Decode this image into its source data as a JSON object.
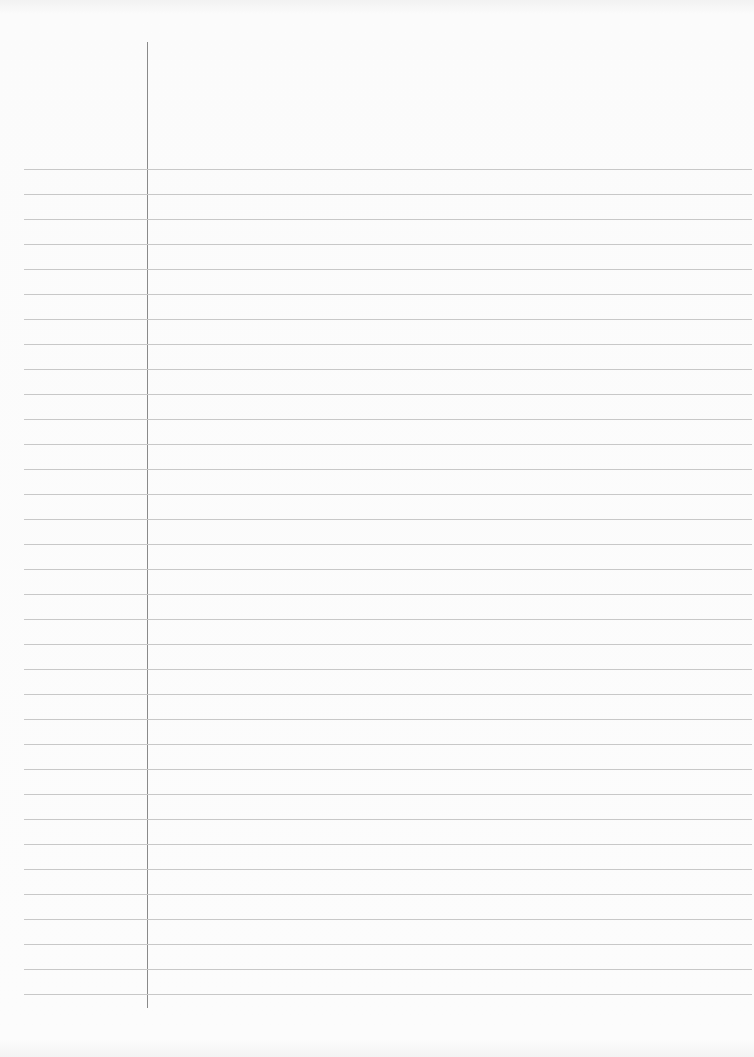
{
  "page": {
    "type": "ruled-notebook-paper",
    "background_color": "#fbfbfb",
    "rule_color": "#c8c8c8",
    "margin_line_color": "#8a8a8a",
    "rule_count": 34,
    "text": ""
  }
}
